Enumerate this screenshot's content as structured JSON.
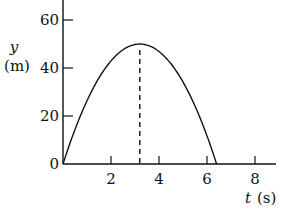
{
  "chart_data": {
    "type": "line",
    "title": "",
    "xlabel": "t (s)",
    "ylabel": "y (m)",
    "xlabel_var": "t",
    "xlabel_unit": "(s)",
    "ylabel_var": "y",
    "ylabel_unit": "(m)",
    "xlim": [
      0,
      8.8
    ],
    "ylim": [
      0,
      67
    ],
    "x_ticks": [
      2,
      4,
      6,
      8
    ],
    "y_ticks": [
      0,
      20,
      40,
      60
    ],
    "grid": false,
    "series": [
      {
        "name": "height vs time",
        "description": "parabolic trajectory, peak ~50 m at t ~3.2 s, returns to 0 at t ~6.4 s",
        "x": [
          0,
          0.5,
          1,
          1.5,
          2,
          2.5,
          3,
          3.2,
          3.5,
          4,
          4.5,
          5,
          5.5,
          6,
          6.4
        ],
        "y": [
          0,
          14.4,
          26.3,
          35.8,
          42.7,
          47.1,
          49.8,
          50,
          49.6,
          46.9,
          41.8,
          34.4,
          24.6,
          12.5,
          0
        ]
      }
    ],
    "annotations": [
      {
        "type": "dashed-vertical-line",
        "x": 3.2,
        "from_y": 0,
        "to_y": 50,
        "label": "time of maximum height"
      }
    ],
    "peak": {
      "t": 3.2,
      "y": 50
    }
  }
}
